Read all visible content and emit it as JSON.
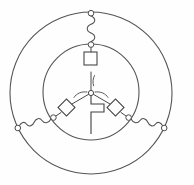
{
  "figure": {
    "kind": "three-phase-machine-schematic",
    "title": "",
    "caption": "",
    "background_color": "#fefefe",
    "line_color": "#4a4a4a",
    "width": 194,
    "height": 185
  },
  "geometry": {
    "center": {
      "x": 91,
      "y": 93
    },
    "outer_circle": {
      "cx": 91,
      "cy": 93,
      "r": 81,
      "label": "stator-outer-ring"
    },
    "inner_circle": {
      "cx": 91,
      "cy": 92,
      "r": 48,
      "label": "rotor-inner-ring"
    },
    "branch_angles_deg": [
      270,
      30,
      150
    ]
  },
  "branches": [
    {
      "id": "phase-a",
      "name": "top-branch",
      "angle_deg": 270,
      "hub_arc": "arc-hub-top",
      "box": {
        "name": "resistor-box-top",
        "rotation_deg": 0,
        "size": 13
      },
      "inner_node": {
        "name": "inner-node-top"
      },
      "coil": {
        "name": "coil-top",
        "turns": 3
      },
      "outer_node": {
        "name": "outer-node-top"
      }
    },
    {
      "id": "phase-b",
      "name": "lower-right-branch",
      "angle_deg": 30,
      "hub_arc": "arc-hub-right",
      "box": {
        "name": "resistor-box-right",
        "rotation_deg": 45,
        "size": 12
      },
      "inner_node": {
        "name": "inner-node-right"
      },
      "coil": {
        "name": "coil-right",
        "turns": 3
      },
      "outer_node": {
        "name": "outer-node-right"
      }
    },
    {
      "id": "phase-c",
      "name": "lower-left-branch",
      "angle_deg": 150,
      "hub_arc": "arc-hub-left",
      "box": {
        "name": "resistor-box-left",
        "rotation_deg": 45,
        "size": 12
      },
      "inner_node": {
        "name": "inner-node-left"
      },
      "coil": {
        "name": "coil-left",
        "turns": 3
      },
      "outer_node": {
        "name": "outer-node-left"
      }
    }
  ],
  "center_hub": {
    "name": "neutral-node",
    "radius": 2.6,
    "step_lead": {
      "name": "step-lead-down",
      "description": "stepped conductor descending from hub"
    }
  },
  "annotations": {
    "labels": []
  }
}
